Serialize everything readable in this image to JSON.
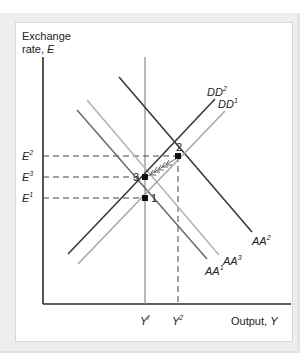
{
  "diagram": {
    "y_axis": {
      "line1": "Exchange",
      "line2": "rate, ",
      "var": "E"
    },
    "x_axis": {
      "label": "Output, ",
      "var": "Y"
    },
    "x_ticks": [
      {
        "base": "Y",
        "sup": "f"
      },
      {
        "base": "Y",
        "sup": "2"
      }
    ],
    "y_ticks": [
      {
        "base": "E",
        "sup": "2"
      },
      {
        "base": "E",
        "sup": "3"
      },
      {
        "base": "E",
        "sup": "1"
      }
    ],
    "curves": [
      {
        "id": "DD2",
        "base": "DD",
        "sup": "2",
        "color": "#3a3a3a"
      },
      {
        "id": "DD1",
        "base": "DD",
        "sup": "1",
        "color": "#a8a8a8"
      },
      {
        "id": "AA2",
        "base": "AA",
        "sup": "2",
        "color": "#3a3a3a"
      },
      {
        "id": "AA1",
        "base": "AA",
        "sup": "1",
        "color": "#6e6e6e"
      },
      {
        "id": "AA3",
        "base": "AA",
        "sup": "3",
        "color": "#b5b5b5"
      }
    ],
    "points": [
      {
        "label": "1"
      },
      {
        "label": "2"
      },
      {
        "label": "3"
      }
    ],
    "colors": {
      "axis": "#2a2a2a",
      "frame_bg": "#eeeeee",
      "panel_bg": "#ffffff",
      "full_employment_line": "#8a8a8a",
      "dashed": "#444444"
    }
  }
}
